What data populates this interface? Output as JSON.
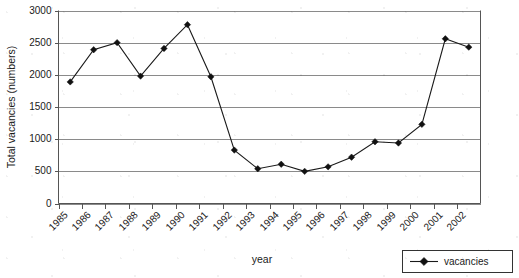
{
  "chart_data": {
    "type": "line",
    "title": "",
    "xlabel": "year",
    "ylabel": "Total vacancies (numbers)",
    "categories": [
      "1985",
      "1986",
      "1987",
      "1988",
      "1989",
      "1990",
      "1991",
      "1992",
      "1993",
      "1994",
      "1995",
      "1996",
      "1997",
      "1998",
      "1999",
      "2000",
      "2001",
      "2002"
    ],
    "series": [
      {
        "name": "vacancies",
        "values": [
          1890,
          2390,
          2500,
          1980,
          2410,
          2780,
          1970,
          830,
          540,
          610,
          500,
          570,
          720,
          960,
          940,
          1230,
          2560,
          2430
        ]
      }
    ],
    "ylim": [
      0,
      3000
    ],
    "yticks": [
      0,
      500,
      1000,
      1500,
      2000,
      2500,
      3000
    ],
    "ytick_labels": [
      "0",
      "500",
      "1000",
      "1500",
      "2000",
      "2500",
      "3000"
    ],
    "grid": true,
    "grid_axis": "y",
    "legend": [
      "vacancies"
    ],
    "legend_position": "bottom-right",
    "marker": "diamond",
    "line_color": "#1a1a1a",
    "grid_color": "#8a8a8a",
    "background_color": "#ffffff"
  },
  "axes": {
    "y_title": "Total vacancies (numbers)",
    "x_title": "year"
  },
  "legend": {
    "entries": [
      {
        "label": "vacancies"
      }
    ]
  }
}
